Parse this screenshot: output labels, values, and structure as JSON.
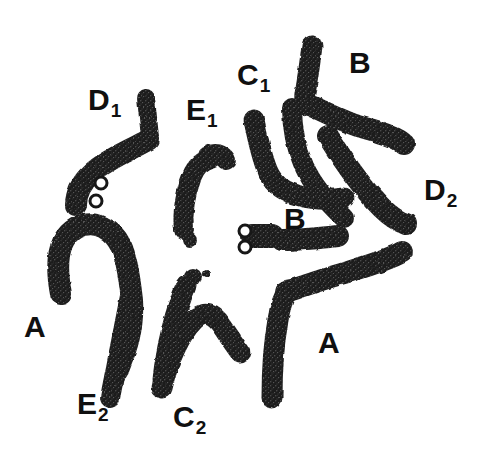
{
  "figure": {
    "name": "chromosome-metaphase-spread",
    "background_color": "#ffffff",
    "ink_color": "#1a1a1a",
    "width": 483,
    "height": 465
  },
  "labels": [
    {
      "id": "label-d1",
      "base": "D",
      "sub": "1",
      "x": 88,
      "y": 85,
      "name": "chromosome-label-d1"
    },
    {
      "id": "label-e1",
      "base": "E",
      "sub": "1",
      "x": 186,
      "y": 95,
      "name": "chromosome-label-e1"
    },
    {
      "id": "label-c1",
      "base": "C",
      "sub": "1",
      "x": 237,
      "y": 60,
      "name": "chromosome-label-c1"
    },
    {
      "id": "label-b-top",
      "base": "B",
      "sub": "",
      "x": 349,
      "y": 48,
      "name": "chromosome-label-b-top"
    },
    {
      "id": "label-d2",
      "base": "D",
      "sub": "2",
      "x": 424,
      "y": 175,
      "name": "chromosome-label-d2"
    },
    {
      "id": "label-b-mid",
      "base": "B",
      "sub": "",
      "x": 284,
      "y": 204,
      "name": "chromosome-label-b-middle"
    },
    {
      "id": "label-a-left",
      "base": "A",
      "sub": "",
      "x": 24,
      "y": 312,
      "name": "chromosome-label-a-left"
    },
    {
      "id": "label-a-right",
      "base": "A",
      "sub": "",
      "x": 318,
      "y": 328,
      "name": "chromosome-label-a-right"
    },
    {
      "id": "label-e2",
      "base": "E",
      "sub": "2",
      "x": 77,
      "y": 389,
      "name": "chromosome-label-e2"
    },
    {
      "id": "label-c2",
      "base": "C",
      "sub": "2",
      "x": 173,
      "y": 402,
      "name": "chromosome-label-c2"
    }
  ],
  "chromosomes": [
    {
      "id": "chrom-d1-short-arm",
      "name": "chromosome-d1-short-arm",
      "group": "D1",
      "path": "M 146,98 L 150,137",
      "width": 18
    },
    {
      "id": "chrom-d1-long-arm",
      "name": "chromosome-d1-long-arm",
      "group": "D1",
      "path": "M 148,140 C 130,150 106,160 92,173 C 80,184 76,196 76,205",
      "width": 22
    },
    {
      "id": "chrom-a-left",
      "name": "chromosome-a-left",
      "group": "A",
      "path": "M 61,294 C 55,262 58,238 76,228 C 96,218 113,230 121,246 C 127,258 130,282 132,300 C 134,330 125,352 118,370",
      "width": 22
    },
    {
      "id": "chrom-e2",
      "name": "chromosome-e2",
      "group": "E2",
      "path": "M 110,398 C 116,368 124,326 130,296",
      "width": 20
    },
    {
      "id": "chrom-e1",
      "name": "chromosome-e1",
      "group": "E1",
      "path": "M 184,230 C 182,212 186,192 192,176 C 196,166 204,160 211,158 M 208,156 C 215,152 222,154 226,160",
      "width": 20
    },
    {
      "id": "chrom-e1-satellite",
      "name": "chromosome-e1-satellite",
      "group": "E1",
      "cx": 190,
      "cy": 240,
      "r": 7
    },
    {
      "id": "chrom-c2-left",
      "name": "chromosome-c2-left",
      "group": "C2",
      "path": "M 163,380 C 166,348 176,308 186,286",
      "width": 21
    },
    {
      "id": "chrom-c2-satellite-large",
      "name": "chromosome-c2-satellite-large",
      "group": "C2",
      "cx": 193,
      "cy": 277,
      "r": 9
    },
    {
      "id": "chrom-c2-satellite-small",
      "name": "chromosome-c2-satellite-small",
      "group": "C2",
      "cx": 206,
      "cy": 274,
      "r": 4
    },
    {
      "id": "chrom-c2-right",
      "name": "chromosome-c2-right",
      "group": "C2",
      "path": "M 162,388 C 168,360 180,334 194,320 C 204,310 214,314 222,326 C 228,335 234,344 240,352",
      "width": 21
    },
    {
      "id": "chrom-c1-left",
      "name": "chromosome-c1-left",
      "group": "C1",
      "path": "M 254,120 C 258,140 262,158 268,172 C 274,186 286,192 300,196 C 314,200 330,200 344,198",
      "width": 21
    },
    {
      "id": "chrom-c1-right",
      "name": "chromosome-c1-right",
      "group": "C1",
      "path": "M 292,108 C 292,128 296,148 304,166 C 314,188 330,205 344,218",
      "width": 20
    },
    {
      "id": "chrom-b-top",
      "name": "chromosome-b-top",
      "group": "B",
      "path": "M 312,46 C 310,62 308,76 306,88 C 304,96 304,102 308,106",
      "width": 21
    },
    {
      "id": "chrom-b-top-long",
      "name": "chromosome-b-top-long",
      "group": "B",
      "path": "M 306,104 C 322,110 340,120 358,126 C 378,132 396,136 404,144",
      "width": 22
    },
    {
      "id": "chrom-d2",
      "name": "chromosome-d2",
      "group": "D2",
      "path": "M 328,136 C 344,162 364,190 382,208 C 392,218 400,222 406,224",
      "width": 22
    },
    {
      "id": "chrom-b-mid-body",
      "name": "chromosome-b-middle-body",
      "group": "B",
      "path": "M 252,236 C 262,236 268,236 272,236",
      "width": 24
    },
    {
      "id": "chrom-b-mid-arm",
      "name": "chromosome-b-middle-arm",
      "group": "B",
      "path": "M 282,240 C 298,240 320,238 338,236",
      "width": 22
    },
    {
      "id": "chrom-a-right-arm1",
      "name": "chromosome-a-right-arm1",
      "group": "A",
      "path": "M 272,398 C 272,370 274,342 278,320 C 280,306 284,296 288,290",
      "width": 21
    },
    {
      "id": "chrom-a-right-arm2",
      "name": "chromosome-a-right-arm2",
      "group": "A",
      "path": "M 286,292 C 304,286 326,278 348,272 C 374,264 392,258 402,252",
      "width": 22
    }
  ],
  "satellite_rings": [
    {
      "id": "ring-d1-upper",
      "name": "satellite-ring-d1-upper",
      "cx": 101,
      "cy": 183,
      "r": 6
    },
    {
      "id": "ring-d1-lower",
      "name": "satellite-ring-d1-lower",
      "cx": 96,
      "cy": 201,
      "r": 6
    },
    {
      "id": "ring-b-upper",
      "name": "satellite-ring-b-upper",
      "cx": 245,
      "cy": 231,
      "r": 6
    },
    {
      "id": "ring-b-lower",
      "name": "satellite-ring-b-lower",
      "cx": 245,
      "cy": 247,
      "r": 6
    }
  ]
}
